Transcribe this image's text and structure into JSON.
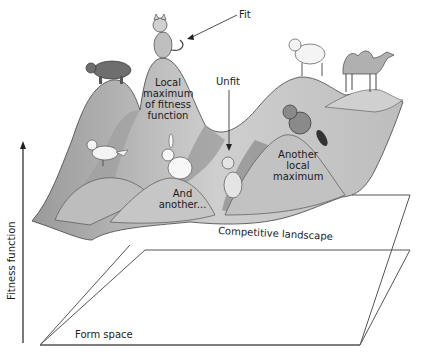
{
  "diagram": {
    "axis": {
      "y_label": "Fitness function",
      "plane_label": "Form space"
    },
    "surface_label": "Competitive landscape",
    "annotations": {
      "fit": "Fit",
      "unfit": "Unfit",
      "local_max_1": "Local maximum of fitness function",
      "local_max_1_lines": [
        "Local",
        "maximum",
        "of fitness",
        "function"
      ],
      "local_max_2_lines": [
        "Another",
        "local",
        "maximum"
      ],
      "and_another_lines": [
        "And",
        "another..."
      ]
    },
    "animals": [
      {
        "name": "cat-fit",
        "position": "top of tallest peak"
      },
      {
        "name": "pig",
        "position": "left peak"
      },
      {
        "name": "bird",
        "position": "low left hill"
      },
      {
        "name": "rabbit",
        "position": "small middle hill"
      },
      {
        "name": "cat-unfit",
        "position": "valley"
      },
      {
        "name": "beaver",
        "position": "right-middle peak"
      },
      {
        "name": "sheep",
        "position": "far right peak"
      },
      {
        "name": "camel",
        "position": "far right ridge"
      }
    ],
    "colors": {
      "surface": "#c8c8c8",
      "surface_shadow": "#8a8a8a",
      "line": "#333333",
      "background": "#ffffff"
    }
  }
}
